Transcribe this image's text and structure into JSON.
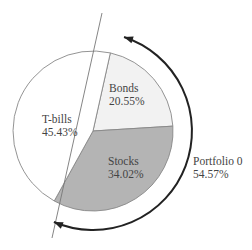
{
  "chart_data": {
    "type": "pie",
    "title": "",
    "slices": [
      {
        "label": "Bonds",
        "value": 20.55,
        "display": "20.55%",
        "color": "#f2f2f2"
      },
      {
        "label": "Stocks",
        "value": 34.02,
        "display": "34.02%",
        "color": "#b4b4b4"
      },
      {
        "label": "T-bills",
        "value": 45.43,
        "display": "45.43%",
        "color": "#ffffff"
      }
    ],
    "annotation": {
      "label": "Portfolio 0",
      "value": 54.57,
      "display": "54.57%",
      "description": "Curved arrow spanning Bonds + Stocks slices"
    },
    "colors": {
      "outline": "#888888",
      "divider_line": "#777777",
      "arrow": "#222222",
      "text": "#444444"
    }
  }
}
